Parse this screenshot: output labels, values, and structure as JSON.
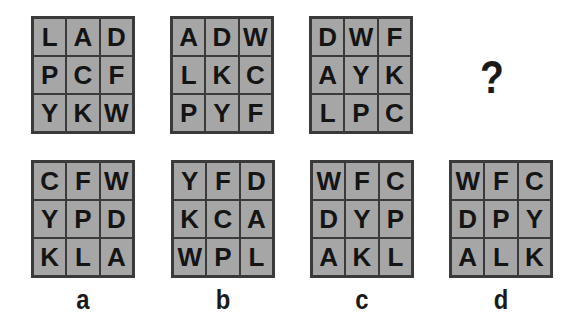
{
  "question": {
    "grids": [
      {
        "cells": [
          "L",
          "A",
          "D",
          "P",
          "C",
          "F",
          "Y",
          "K",
          "W"
        ]
      },
      {
        "cells": [
          "A",
          "D",
          "W",
          "L",
          "K",
          "C",
          "P",
          "Y",
          "F"
        ]
      },
      {
        "cells": [
          "D",
          "W",
          "F",
          "A",
          "Y",
          "K",
          "L",
          "P",
          "C"
        ]
      }
    ],
    "missing_symbol": "?"
  },
  "options": [
    {
      "label": "a",
      "cells": [
        "C",
        "F",
        "W",
        "Y",
        "P",
        "D",
        "K",
        "L",
        "A"
      ]
    },
    {
      "label": "b",
      "cells": [
        "Y",
        "F",
        "D",
        "K",
        "C",
        "A",
        "W",
        "P",
        "L"
      ]
    },
    {
      "label": "c",
      "cells": [
        "W",
        "F",
        "C",
        "D",
        "Y",
        "P",
        "A",
        "K",
        "L"
      ]
    },
    {
      "label": "d",
      "cells": [
        "W",
        "F",
        "C",
        "D",
        "P",
        "Y",
        "A",
        "L",
        "K"
      ]
    }
  ],
  "colors": {
    "cell_fill": "#a6a6a6",
    "border": "#3a3a3a",
    "text": "#141414"
  }
}
